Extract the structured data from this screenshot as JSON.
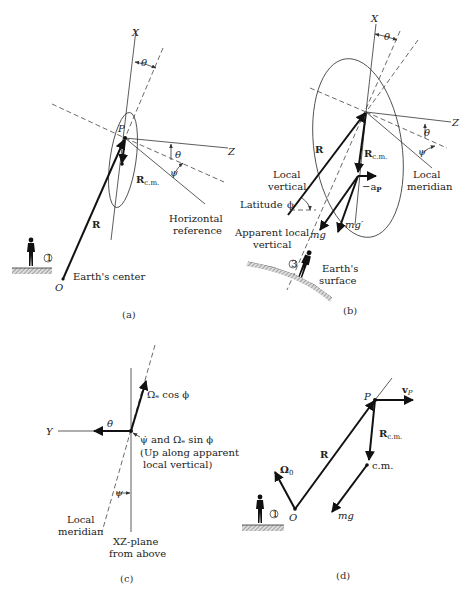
{
  "panels": {
    "a": {
      "caption": "(a)",
      "axes": {
        "x": "X",
        "z": "Z"
      },
      "angles": {
        "theta": "θ",
        "psi": "ψ"
      },
      "point_p": "P",
      "vectors": {
        "r": "R",
        "rcm": "R",
        "rcm_sub": "c.m."
      },
      "labels": {
        "horizontal_reference_1": "Horizontal",
        "horizontal_reference_2": "reference",
        "earth_center": "Earth's center",
        "origin": "O",
        "observer_badge": "1"
      }
    },
    "b": {
      "caption": "(b)",
      "axes": {
        "x": "X",
        "z": "Z"
      },
      "angles": {
        "theta": "θ",
        "psi": "ψ",
        "phi": "ϕ"
      },
      "vectors": {
        "r": "R",
        "rcm": "R",
        "rcm_sub": "c.m.",
        "ap": "−a",
        "ap_sub": "P",
        "mg": "mg",
        "mgprime": "mg′"
      },
      "labels": {
        "local_vertical_1": "Local",
        "local_vertical_2": "vertical",
        "latitude": "Latitude",
        "local_meridian_1": "Local",
        "local_meridian_2": "meridian",
        "apparent_1": "Apparent local",
        "apparent_2": "vertical",
        "earth_surface_1": "Earth's",
        "earth_surface_2": "surface",
        "observer_badge": "3"
      }
    },
    "c": {
      "caption": "(c)",
      "axes": {
        "y": "Y"
      },
      "angles": {
        "theta_dot": "θ̇",
        "psi": "ψ"
      },
      "labels": {
        "omega_cos": "Ωₑ cos ϕ",
        "psi_dot_line": "ψ̇ and Ωₑ sin ϕ",
        "up_along_1": "(Up along apparent",
        "up_along_2": "local vertical)",
        "local_meridian_1": "Local",
        "local_meridian_2": "meridian",
        "xz_plane_1": "XZ-plane",
        "xz_plane_2": "from above"
      }
    },
    "d": {
      "caption": "(d)",
      "point_p": "P",
      "origin": "O",
      "vectors": {
        "vp": "v",
        "vp_sub": "P",
        "r": "R",
        "rcm": "R",
        "rcm_sub": "c.m.",
        "omega0": "Ω",
        "omega0_sub": "0",
        "mg": "mg"
      },
      "labels": {
        "cm": "c.m.",
        "observer_badge": "1"
      }
    }
  }
}
